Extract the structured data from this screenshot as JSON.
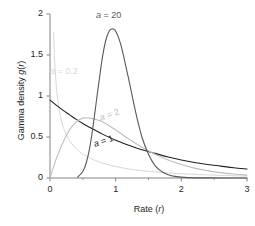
{
  "figure": {
    "background": "#ffffff"
  },
  "axes": {
    "x_title": "Rate (r)",
    "y_title": "Gamma density g(r)",
    "x_ticks": [
      "0",
      "1",
      "2",
      "3"
    ],
    "y_ticks": [
      "0",
      "0.5",
      "1",
      "1.5",
      "2"
    ],
    "axis_color": "#808285"
  },
  "labels": {
    "a20": "a = 20",
    "a02": "a = 0.2",
    "a2": "a = 2",
    "a1": "a = 1"
  },
  "chart_data": {
    "type": "line",
    "title": "",
    "xlabel": "Rate (r)",
    "ylabel": "Gamma density g(r)",
    "xlim": [
      0,
      3
    ],
    "ylim": [
      0,
      2
    ],
    "xticks": [
      0,
      1,
      2,
      3
    ],
    "yticks": [
      0,
      0.5,
      1,
      1.5,
      2
    ],
    "xminorticks": [
      0.5,
      1.5,
      2.5
    ],
    "grid": false,
    "legend": "inline-annotations",
    "annotations": [
      {
        "text": "a = 20",
        "x": 0.72,
        "y": 1.96,
        "color": "#58595b"
      },
      {
        "text": "a = 0.2",
        "x": 0.03,
        "y": 1.33,
        "color": "#d6d7d8"
      },
      {
        "text": "a = 2",
        "x": 0.77,
        "y": 0.76,
        "color": "#bcbec0"
      },
      {
        "text": "a = 1",
        "x": 0.68,
        "y": 0.46,
        "color": "#231f20"
      }
    ],
    "series": [
      {
        "name": "a = 0.2",
        "shape_parameter": 0.2,
        "color": "#d6d7d8",
        "linewidth": 1,
        "x": [
          0.055,
          0.07,
          0.09,
          0.11,
          0.14,
          0.18,
          0.22,
          0.28,
          0.35,
          0.45,
          0.55,
          0.7,
          0.85,
          1.0,
          1.2,
          1.4,
          1.6,
          1.8,
          2.0,
          2.2,
          2.4,
          2.6,
          2.8,
          3.0
        ],
        "y": [
          1.78,
          1.45,
          1.18,
          1.0,
          0.83,
          0.68,
          0.58,
          0.48,
          0.4,
          0.32,
          0.27,
          0.21,
          0.17,
          0.14,
          0.11,
          0.09,
          0.075,
          0.062,
          0.052,
          0.044,
          0.038,
          0.032,
          0.028,
          0.024
        ]
      },
      {
        "name": "a = 1",
        "shape_parameter": 1,
        "color": "#231f20",
        "linewidth": 1.1,
        "x": [
          0.0,
          0.1,
          0.2,
          0.3,
          0.4,
          0.5,
          0.6,
          0.8,
          1.0,
          1.2,
          1.4,
          1.6,
          1.8,
          2.0,
          2.2,
          2.4,
          2.6,
          2.8,
          3.0
        ],
        "y": [
          0.95,
          0.885,
          0.825,
          0.77,
          0.715,
          0.665,
          0.62,
          0.535,
          0.46,
          0.4,
          0.345,
          0.3,
          0.255,
          0.22,
          0.19,
          0.165,
          0.145,
          0.125,
          0.11
        ]
      },
      {
        "name": "a = 2",
        "shape_parameter": 2,
        "color": "#bcbec0",
        "linewidth": 1.1,
        "x": [
          0.0,
          0.1,
          0.2,
          0.3,
          0.4,
          0.5,
          0.6,
          0.7,
          0.8,
          1.0,
          1.2,
          1.4,
          1.6,
          1.8,
          2.0,
          2.2,
          2.4,
          2.6,
          2.8,
          3.0
        ],
        "y": [
          0.0,
          0.245,
          0.44,
          0.59,
          0.685,
          0.73,
          0.73,
          0.715,
          0.685,
          0.585,
          0.475,
          0.375,
          0.29,
          0.22,
          0.165,
          0.12,
          0.09,
          0.065,
          0.048,
          0.035
        ]
      },
      {
        "name": "a = 20",
        "shape_parameter": 20,
        "color": "#58595b",
        "linewidth": 1.1,
        "x": [
          0.42,
          0.5,
          0.55,
          0.6,
          0.65,
          0.7,
          0.75,
          0.8,
          0.85,
          0.9,
          0.95,
          0.98,
          1.0,
          1.05,
          1.1,
          1.15,
          1.2,
          1.3,
          1.4,
          1.5,
          1.6,
          1.7,
          1.8,
          1.9,
          2.1,
          2.4,
          3.0
        ],
        "y": [
          0.01,
          0.08,
          0.18,
          0.35,
          0.6,
          0.9,
          1.2,
          1.48,
          1.68,
          1.79,
          1.82,
          1.81,
          1.79,
          1.7,
          1.56,
          1.38,
          1.2,
          0.82,
          0.5,
          0.29,
          0.15,
          0.08,
          0.04,
          0.02,
          0.005,
          0.001,
          0.0
        ]
      }
    ]
  }
}
